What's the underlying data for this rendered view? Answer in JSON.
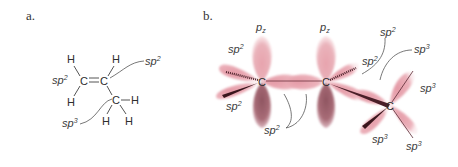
{
  "panels": {
    "a": {
      "label": "a.",
      "atoms": {
        "c1": "C",
        "c2": "C",
        "c3": "C",
        "h": "H"
      },
      "labels": {
        "left_sp2": {
          "base": "sp",
          "sup": "2"
        },
        "right_sp2": {
          "base": "sp",
          "sup": "2"
        },
        "sp3": {
          "base": "sp",
          "sup": "3"
        }
      }
    },
    "b": {
      "label": "b.",
      "atoms": {
        "c1": "C",
        "c2": "C",
        "c3": "C"
      },
      "labels": {
        "pz_left": {
          "base": "p",
          "sub": "z"
        },
        "pz_right": {
          "base": "p",
          "sub": "z"
        },
        "sp2_top_left": {
          "base": "sp",
          "sup": "2"
        },
        "sp2_bottom_left": {
          "base": "sp",
          "sup": "2"
        },
        "sp2_bottom_center": {
          "base": "sp",
          "sup": "2"
        },
        "sp2_right_of_c2": {
          "base": "sp",
          "sup": "2"
        },
        "sp2_top_right": {
          "base": "sp",
          "sup": "2"
        },
        "sp3_top": {
          "base": "sp",
          "sup": "3"
        },
        "sp3_right": {
          "base": "sp",
          "sup": "3"
        },
        "sp3_bottom_left": {
          "base": "sp",
          "sup": "3"
        },
        "sp3_bottom_right": {
          "base": "sp",
          "sup": "3"
        }
      }
    }
  },
  "colors": {
    "orbital_light": "#e8a9b2",
    "orbital_dark": "#9c5f6a",
    "orbital_glow": "#f3cdd3",
    "text": "#3a3a3a"
  }
}
